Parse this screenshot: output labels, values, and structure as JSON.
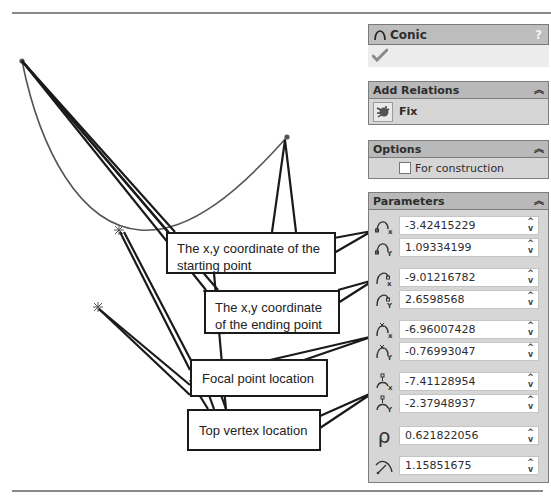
{
  "panel": {
    "title": "Conic",
    "help_label": "?",
    "ok_icon": "checkmark-icon",
    "sections": {
      "add_relations": {
        "title": "Add Relations",
        "items": [
          {
            "label": "Fix",
            "icon": "fix-anchor-icon"
          }
        ]
      },
      "options": {
        "title": "Options",
        "for_construction_label": "For construction",
        "for_construction_checked": false
      },
      "parameters": {
        "title": "Parameters",
        "fields": [
          {
            "name": "start-x",
            "icon": "start-point-x-icon",
            "value": "-3.42415229"
          },
          {
            "name": "start-y",
            "icon": "start-point-y-icon",
            "value": "1.09334199"
          },
          {
            "name": "end-x",
            "icon": "end-point-x-icon",
            "value": "-9.01216782"
          },
          {
            "name": "end-y",
            "icon": "end-point-y-icon",
            "value": "2.6598568"
          },
          {
            "name": "focal-x",
            "icon": "focal-point-x-icon",
            "value": "-6.96007428"
          },
          {
            "name": "focal-y",
            "icon": "focal-point-y-icon",
            "value": "-0.76993047"
          },
          {
            "name": "vertex-x",
            "icon": "top-vertex-x-icon",
            "value": "-7.41128954"
          },
          {
            "name": "vertex-y",
            "icon": "top-vertex-y-icon",
            "value": "-2.37948937"
          },
          {
            "name": "rho",
            "icon": "rho-icon",
            "symbol": "ρ",
            "value": "0.621822056"
          },
          {
            "name": "curvature",
            "icon": "curvature-icon",
            "value": "1.15851675"
          }
        ]
      }
    }
  },
  "callouts": {
    "start": "The x,y coordinate of the starting point",
    "start_line1": "The x,y coordinate of the",
    "start_line2": "starting point",
    "end_line1": "The x,y coordinate",
    "end_line2": "of the ending point",
    "focal": "Focal point location",
    "vertex": "Top vertex location"
  },
  "colors": {
    "panel_header": "#b9b9b9",
    "panel_body": "#d6d6d6",
    "curve": "#555555",
    "leader": "#1a1a1a"
  }
}
